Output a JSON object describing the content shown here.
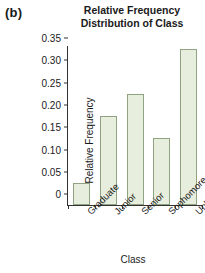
{
  "panel": {
    "label": "(b)"
  },
  "chart_data": {
    "type": "bar",
    "title": "Relative Frequency Distribution of Class",
    "title_lines": [
      "Relative Frequency",
      "Distribution of Class"
    ],
    "xlabel": "Class",
    "ylabel": "Relative Frequency",
    "categories": [
      "Graduate",
      "Junior",
      "Senior",
      "Sophomore",
      "Unknown"
    ],
    "values": [
      0.05,
      0.2,
      0.25,
      0.15,
      0.35
    ],
    "yticks": [
      "0",
      "0.05",
      "0.10",
      "0.15",
      "0.20",
      "0.25",
      "0.30",
      "0.35"
    ],
    "ytick_values": [
      0,
      0.05,
      0.1,
      0.15,
      0.2,
      0.25,
      0.3,
      0.35
    ],
    "ylim": [
      0,
      0.355
    ],
    "grid": false,
    "legend": false,
    "bar_fill": "#e8eede",
    "bar_border": "#8fa383",
    "axis_color": "#333333"
  }
}
